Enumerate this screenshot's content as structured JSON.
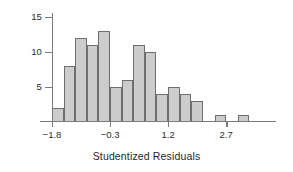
{
  "chart_data": {
    "type": "bar",
    "title": "",
    "xlabel": "Studentized Residuals",
    "ylabel": "",
    "categories": [
      "-1.8 to -1.5",
      "-1.5 to -1.2",
      "-1.2 to -0.9",
      "-0.9 to -0.6",
      "-0.6 to -0.3",
      "-0.3 to 0.0",
      "0.0 to 0.3",
      "0.3 to 0.6",
      "0.6 to 0.9",
      "0.9 to 1.2",
      "1.2 to 1.5",
      "1.5 to 1.8",
      "1.8 to 2.1",
      "2.1 to 2.4",
      "2.4 to 2.7",
      "2.7 to 3.0",
      "3.0 to 3.3",
      "3.3 to 3.6"
    ],
    "values": [
      2,
      8,
      12,
      11,
      13,
      5,
      6,
      11,
      10,
      4,
      5,
      4,
      3,
      0,
      1,
      0,
      1,
      0
    ],
    "bin_starts": [
      -1.8,
      -1.5,
      -1.2,
      -0.9,
      -0.6,
      -0.3,
      0.0,
      0.3,
      0.6,
      0.9,
      1.2,
      1.5,
      1.8,
      2.1,
      2.4,
      2.7,
      3.0,
      3.3
    ],
    "bin_width": 0.3,
    "xlim": [
      -2.4,
      3.9
    ],
    "ylim": [
      0,
      15.6
    ],
    "xticks": [
      -1.8,
      -0.3,
      1.2,
      2.7
    ],
    "xtick_labels": [
      "−1.8",
      "−0.3",
      "1.2",
      "2.7"
    ],
    "yticks": [
      5,
      10,
      15
    ],
    "ytick_labels": [
      "5",
      "10",
      "15"
    ],
    "grid": false,
    "legend": "none",
    "bar_fill_color": "#cccccc",
    "bar_border_color": "#6e6e6e",
    "axis_color": "#7a7a7a",
    "background_color": "#ffffff"
  }
}
